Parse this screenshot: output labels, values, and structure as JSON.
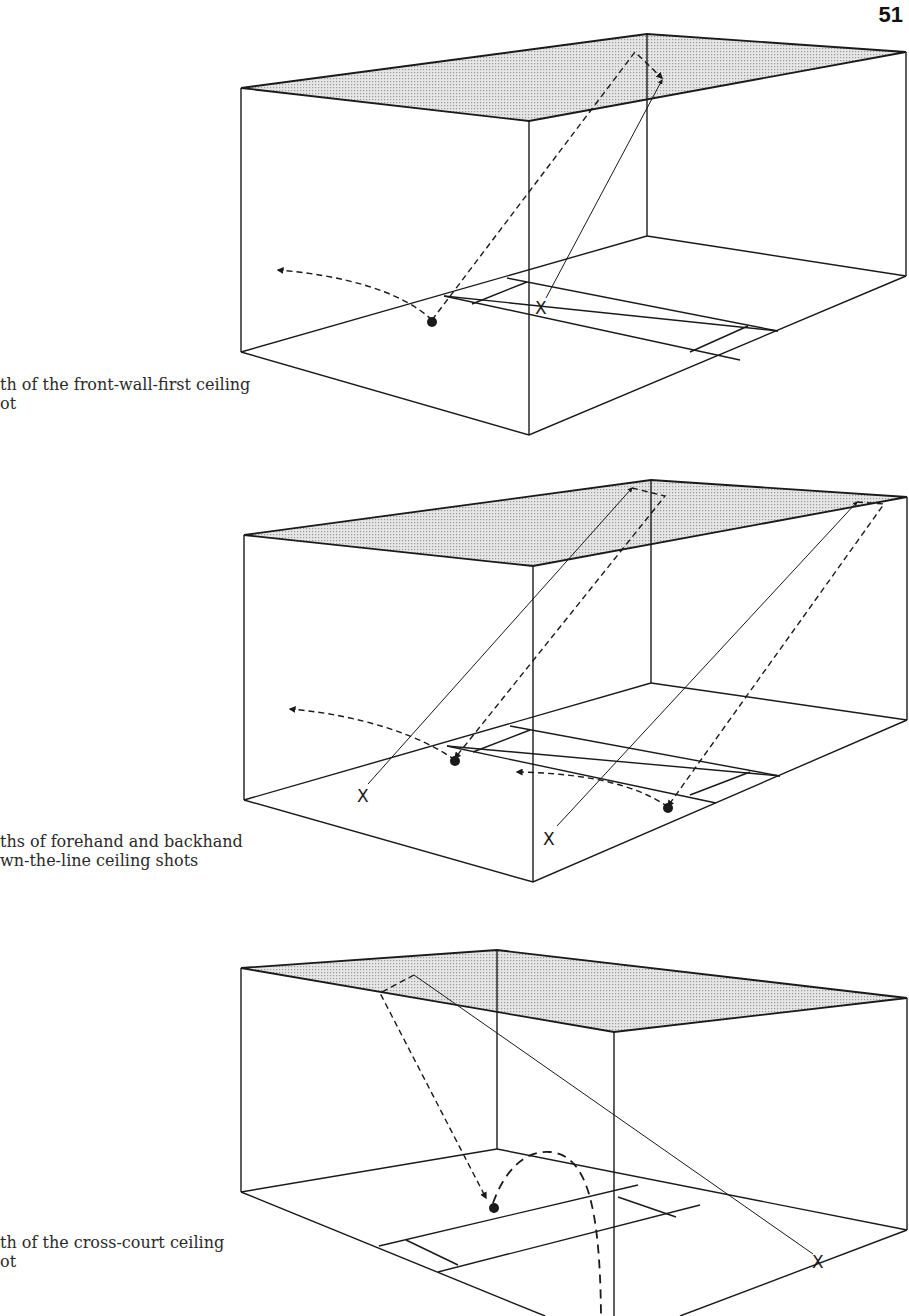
{
  "page": {
    "number": "51"
  },
  "figures": [
    {
      "id": "fig1",
      "caption_lines": [
        "th of the front-wall-first ceiling",
        "ot"
      ],
      "labels": {
        "x_marker": "X"
      }
    },
    {
      "id": "fig2",
      "caption_lines": [
        "ths of forehand and backhand",
        "wn-the-line ceiling shots"
      ],
      "labels": {
        "x_marker_left": "X",
        "x_marker_right": "X"
      }
    },
    {
      "id": "fig3",
      "caption_lines": [
        "th of the cross-court ceiling",
        "ot"
      ],
      "labels": {
        "x_marker": "X"
      }
    }
  ],
  "colors": {
    "line": "#1a1a1a",
    "ceiling_fill": "#d2d2d2",
    "background": "#ffffff"
  }
}
